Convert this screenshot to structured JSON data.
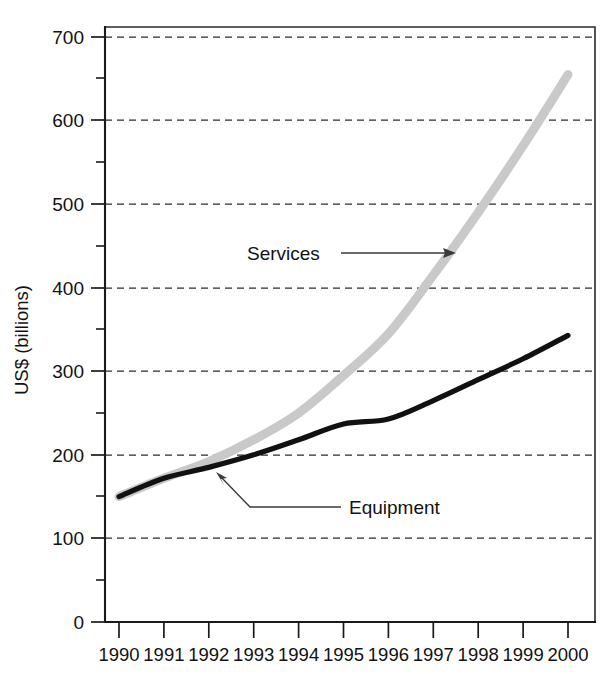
{
  "chart_data": {
    "type": "line",
    "title": "",
    "xlabel": "",
    "ylabel": "US$ (billions)",
    "x": [
      1990,
      1991,
      1992,
      1993,
      1994,
      1995,
      1996,
      1997,
      1998,
      1999,
      2000
    ],
    "xtick_labels": [
      "1990",
      "1991",
      "1992",
      "1993",
      "1994",
      "1995",
      "1996",
      "1997",
      "1998",
      "1999",
      "2000"
    ],
    "ytick_labels": [
      "0",
      "100",
      "200",
      "300",
      "400",
      "500",
      "600",
      "700"
    ],
    "ytick_values": [
      0,
      100,
      200,
      300,
      400,
      500,
      600,
      700
    ],
    "yminor_values": [
      50,
      150,
      250,
      350,
      450,
      550,
      650
    ],
    "ylim": [
      0,
      720
    ],
    "xlim": [
      1989.7,
      2000.6
    ],
    "grid": "horizontal-dashed",
    "legend_position": "inline-annotations",
    "series": [
      {
        "name": "Services",
        "color": "#c9c9c9",
        "values": [
          150,
          172,
          192,
          218,
          250,
          295,
          345,
          415,
          490,
          570,
          655
        ]
      },
      {
        "name": "Equipment",
        "color": "#111111",
        "values": [
          150,
          172,
          185,
          200,
          218,
          237,
          243,
          265,
          290,
          315,
          343
        ]
      }
    ],
    "annotations": [
      {
        "id": "services-annotation",
        "text": "Services",
        "points_to_series": "Services",
        "points_to_x": 1997.3,
        "points_to_y": 437
      },
      {
        "id": "equipment-annotation",
        "text": "Equipment",
        "points_to_series": "Equipment",
        "points_to_x": 1992.2,
        "points_to_y": 188
      }
    ]
  }
}
